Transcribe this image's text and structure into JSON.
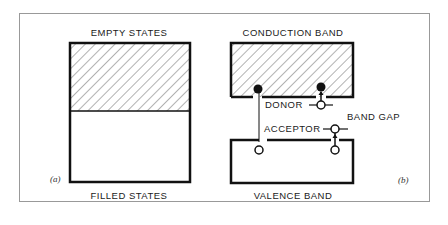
{
  "figure": {
    "panel_a": {
      "tag": "(a)",
      "top_label": "EMPTY   STATES",
      "bottom_label": "FILLED   STATES"
    },
    "panel_b": {
      "tag": "(b)",
      "top_label": "CONDUCTION   BAND",
      "bottom_label": "VALENCE   BAND",
      "donor_label": "DONOR",
      "acceptor_label": "ACCEPTOR",
      "gap_label": "BAND   GAP"
    },
    "colors": {
      "line": "#111111",
      "frame": "#999999",
      "background": "#ffffff"
    }
  }
}
